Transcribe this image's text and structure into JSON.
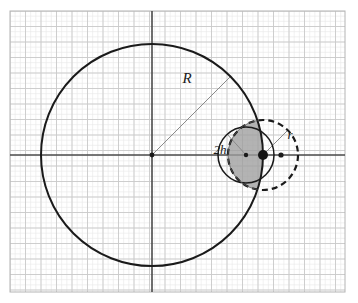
{
  "figure": {
    "background_color": "#ffffff",
    "width": 358,
    "height": 303
  },
  "grid": {
    "name": "graph-paper-grid",
    "origin_x": 10,
    "origin_y": 11,
    "right": 345,
    "bottom": 292,
    "cell_size": 15.5,
    "minor_cell_size": 5.167,
    "minor_color": "#e8e8e8",
    "major_color": "#c9c9c9",
    "border_color": "#b4b4b4"
  },
  "axes": {
    "name": "coordinate-axes",
    "color": "#4a4a4a",
    "stroke_width": 1.6,
    "x_axis_y": 155,
    "y_axis_x": 152,
    "x_axis_start": 10,
    "x_axis_end": 345,
    "y_axis_start": 11,
    "y_axis_end": 292
  },
  "shapes": {
    "big_circle": {
      "name": "large-circle",
      "cx": 152,
      "cy": 155,
      "r": 111,
      "stroke": "#1a1a1a",
      "stroke_width": 2.0,
      "style": "solid"
    },
    "small_circle": {
      "name": "small-solid-circle",
      "cx": 246,
      "cy": 155,
      "r": 28,
      "stroke": "#1a1a1a",
      "stroke_width": 1.5,
      "style": "solid"
    },
    "dashed_circle": {
      "name": "dashed-circle",
      "cx": 263,
      "cy": 155,
      "r": 35,
      "stroke": "#1a1a1a",
      "stroke_width": 2.2,
      "style": "dashed",
      "dash_pattern": "6 4"
    },
    "lens": {
      "name": "shaded-lens-region",
      "fill": "#9e9e9e",
      "fill_opacity": 0.78,
      "stroke": "#555555",
      "stroke_width": 0.8,
      "description": "intersection of large circle and dashed circle"
    }
  },
  "points": [
    {
      "name": "big-circle-center-dot",
      "cx": 152,
      "cy": 155,
      "r": 2.4,
      "color": "#1a1a1a"
    },
    {
      "name": "small-circle-center-dot",
      "cx": 246,
      "cy": 155,
      "r": 2.2,
      "color": "#1a1a1a"
    },
    {
      "name": "tangency-point-dot",
      "cx": 263,
      "cy": 155,
      "r": 5.0,
      "color": "#141414"
    },
    {
      "name": "right-point-dot",
      "cx": 281,
      "cy": 155,
      "r": 2.6,
      "color": "#1a1a1a"
    }
  ],
  "radius_lines": [
    {
      "name": "radius-line-R",
      "x1": 152,
      "y1": 155,
      "x2": 230,
      "y2": 77,
      "color": "#8a8a8a",
      "stroke_width": 1.0
    },
    {
      "name": "radius-line-2h",
      "x1": 246,
      "y1": 155,
      "x2": 227,
      "y2": 134,
      "color": "#8a8a8a",
      "stroke_width": 1.0
    },
    {
      "name": "radius-line-r",
      "x1": 263,
      "y1": 155,
      "x2": 288,
      "y2": 130,
      "color": "#8a8a8a",
      "stroke_width": 1.0
    }
  ],
  "labels": {
    "R": {
      "name": "label-R",
      "text": "R",
      "x": 187,
      "y": 83,
      "font_size": 15
    },
    "two_h": {
      "name": "label-2h",
      "text": "2h",
      "x": 220,
      "y": 154,
      "font_size": 13
    },
    "r": {
      "name": "label-r",
      "text": "r",
      "x": 290,
      "y": 139,
      "font_size": 13
    }
  }
}
